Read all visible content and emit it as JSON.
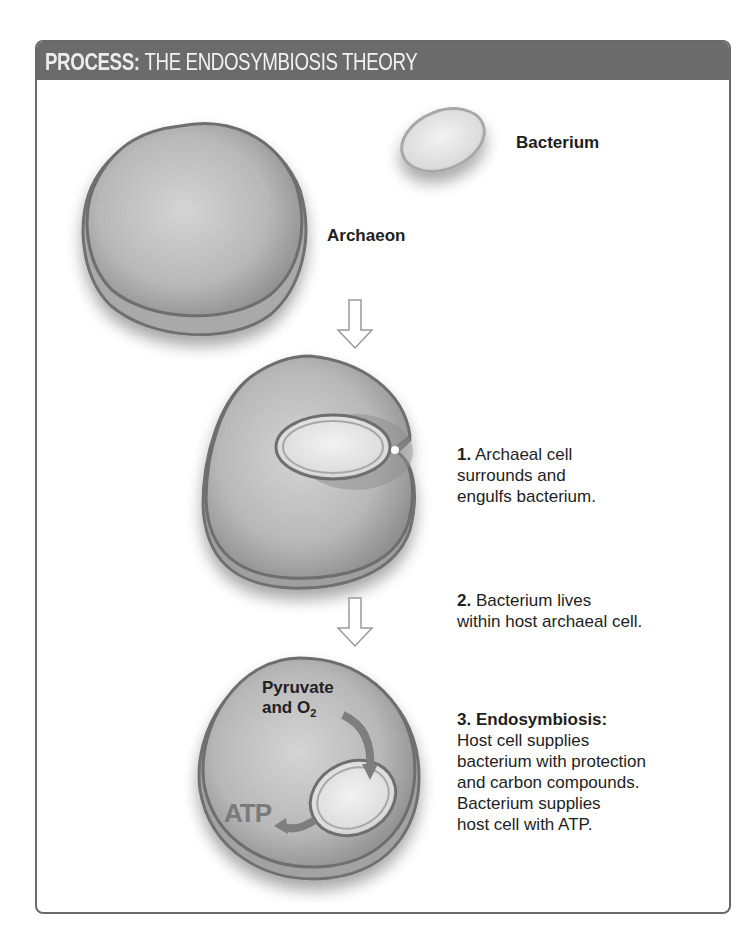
{
  "header": {
    "prefix": "PROCESS:",
    "title": "THE ENDOSYMBIOSIS THEORY"
  },
  "labels": {
    "bacterium": "Bacterium",
    "archaeon": "Archaeon"
  },
  "steps": [
    {
      "number": "1.",
      "lines": [
        "Archaeal cell",
        "surrounds and",
        "engulfs bacterium."
      ]
    },
    {
      "number": "2.",
      "lines": [
        "Bacterium lives",
        "within host archaeal cell."
      ]
    },
    {
      "number": "3.",
      "heading": "Endosymbiosis:",
      "lines": [
        "Host cell supplies",
        "bacterium with protection",
        "and carbon compounds.",
        "Bacterium supplies",
        "host cell with ATP."
      ]
    }
  ],
  "inner_labels": {
    "pyruvate": "Pyruvate",
    "and": "and O",
    "o2_sub": "2",
    "atp": "ATP"
  },
  "colors": {
    "header_bg": "#6b6b6b",
    "cell_fill": "#b5b5b5",
    "cell_edge": "#6e6e6e",
    "frame_border": "#6a6a6a"
  }
}
